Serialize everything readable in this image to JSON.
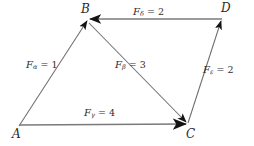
{
  "figure": {
    "background_color": "#ffffff",
    "line_color": "#6b6b6b",
    "arrow_color": "#1a1a1a",
    "text_color": "#2b2b2b"
  },
  "vertices": [
    {
      "id": "A",
      "label": "A",
      "x": 19,
      "y": 126
    },
    {
      "id": "B",
      "label": "B",
      "x": 87,
      "y": 20
    },
    {
      "id": "C",
      "label": "C",
      "x": 188,
      "y": 124
    },
    {
      "id": "D",
      "label": "D",
      "x": 222,
      "y": 18
    }
  ],
  "vectors": [
    {
      "id": "alpha",
      "symbol": "F",
      "subscript": "α",
      "equals": "=",
      "magnitude": "1",
      "label_text": "Fα = 1",
      "from": "A",
      "to": "B",
      "label_x": 26,
      "label_y": 60
    },
    {
      "id": "beta",
      "symbol": "F",
      "subscript": "β",
      "equals": "=",
      "magnitude": "3",
      "label_text": "Fβ = 3",
      "from": "B",
      "to": "C",
      "label_x": 115,
      "label_y": 60
    },
    {
      "id": "gamma",
      "symbol": "F",
      "subscript": "γ",
      "equals": "=",
      "magnitude": "4",
      "label_text": "Fγ = 4",
      "from": "A",
      "to": "C",
      "label_x": 84,
      "label_y": 108
    },
    {
      "id": "delta",
      "symbol": "F",
      "subscript": "δ",
      "equals": "=",
      "magnitude": "2",
      "label_text": "Fδ = 2",
      "from": "D",
      "to": "B",
      "label_x": 133,
      "label_y": 7
    },
    {
      "id": "epsilon",
      "symbol": "F",
      "subscript": "ε",
      "equals": "=",
      "magnitude": "2",
      "label_text": "Fε = 2",
      "from": "C",
      "to": "D",
      "label_x": 203,
      "label_y": 65
    }
  ]
}
